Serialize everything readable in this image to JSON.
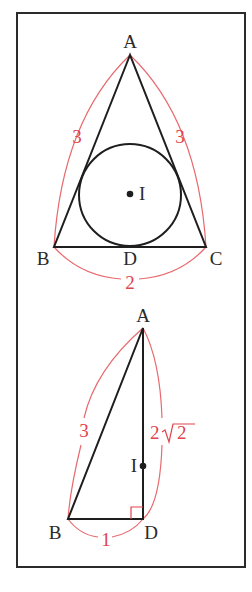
{
  "colors": {
    "frame": "#2b2b2b",
    "edge": "#1e1e1e",
    "measure": "#e0444c",
    "background": "#ffffff"
  },
  "figure_top": {
    "description": "Isosceles triangle ABC with inscribed circle centered at I, tangent to BC at D",
    "vertices": {
      "A": "A",
      "B": "B",
      "C": "C",
      "D": "D",
      "I": "I"
    },
    "measures": {
      "AB": "3",
      "AC": "3",
      "BC": "2"
    }
  },
  "figure_bottom": {
    "description": "Right triangle ABD with right angle at D, point I on AD",
    "vertices": {
      "A": "A",
      "B": "B",
      "D": "D",
      "I": "I"
    },
    "measures": {
      "AB": "3",
      "AD_coef": "2",
      "AD_radicand": "2",
      "BD": "1"
    }
  }
}
